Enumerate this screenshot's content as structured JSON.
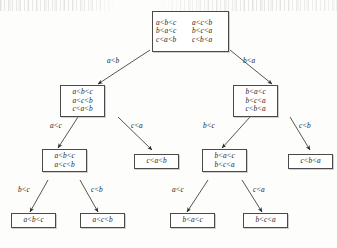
{
  "figure": {
    "type": "decision-tree"
  },
  "nodes": [
    {
      "id": "root",
      "name": "root-node",
      "columns": 2,
      "rows": [
        [
          "a<b<c",
          "a<c<b"
        ],
        [
          "b<a<c",
          "b<c<a"
        ],
        [
          "c<a<b",
          "c<b<a"
        ]
      ]
    },
    {
      "id": "L",
      "name": "node-a-lt-b",
      "columns": 1,
      "rows": [
        [
          "a<b<c"
        ],
        [
          "a<c<b"
        ],
        [
          "c<a<b"
        ]
      ]
    },
    {
      "id": "R",
      "name": "node-b-lt-a",
      "columns": 1,
      "rows": [
        [
          "b<a<c"
        ],
        [
          "b<c<a"
        ],
        [
          "c<b<a"
        ]
      ]
    },
    {
      "id": "LL",
      "name": "node-a-lt-b-a-lt-c",
      "columns": 1,
      "rows": [
        [
          "a<b<c"
        ],
        [
          "a<c<b"
        ]
      ]
    },
    {
      "id": "LR",
      "name": "leaf-c-lt-a-lt-b",
      "columns": 1,
      "rows": [
        [
          "c<a<b"
        ]
      ]
    },
    {
      "id": "RL",
      "name": "node-b-lt-a-b-lt-c",
      "columns": 1,
      "rows": [
        [
          "b<a<c"
        ],
        [
          "b<c<a"
        ]
      ]
    },
    {
      "id": "RR",
      "name": "leaf-c-lt-b-lt-a",
      "columns": 1,
      "rows": [
        [
          "c<b<a"
        ]
      ]
    },
    {
      "id": "LLL",
      "name": "leaf-a-lt-b-lt-c",
      "columns": 1,
      "rows": [
        [
          "a<b<c"
        ]
      ]
    },
    {
      "id": "LLR",
      "name": "leaf-a-lt-c-lt-b",
      "columns": 1,
      "rows": [
        [
          "a<c<b"
        ]
      ]
    },
    {
      "id": "RLL",
      "name": "leaf-b-lt-a-lt-c",
      "columns": 1,
      "rows": [
        [
          "b<a<c"
        ]
      ]
    },
    {
      "id": "RLR",
      "name": "leaf-b-lt-c-lt-a",
      "columns": 1,
      "rows": [
        [
          "b<c<a"
        ]
      ]
    }
  ],
  "edges": [
    {
      "name": "edge-root-left",
      "label": "a<b",
      "from": "root",
      "to": "L"
    },
    {
      "name": "edge-root-right",
      "label": "b<a",
      "from": "root",
      "to": "R"
    },
    {
      "name": "edge-l-left",
      "label": "a<c",
      "from": "L",
      "to": "LL"
    },
    {
      "name": "edge-l-right",
      "label": "c<a",
      "from": "L",
      "to": "LR"
    },
    {
      "name": "edge-r-left",
      "label": "b<c",
      "from": "R",
      "to": "RL"
    },
    {
      "name": "edge-r-right",
      "label": "c<b",
      "from": "R",
      "to": "RR"
    },
    {
      "name": "edge-ll-left",
      "label": "b<c",
      "from": "LL",
      "to": "LLL"
    },
    {
      "name": "edge-ll-right",
      "label": "c<b",
      "from": "LL",
      "to": "LLR"
    },
    {
      "name": "edge-rl-left",
      "label": "a<c",
      "from": "RL",
      "to": "RLL"
    },
    {
      "name": "edge-rl-right",
      "label": "c<a",
      "from": "RL",
      "to": "RLR"
    }
  ],
  "colors": {
    "ink": "#1c1c1c",
    "border": "#4a4a4a",
    "paper": "#fdfdfb"
  }
}
